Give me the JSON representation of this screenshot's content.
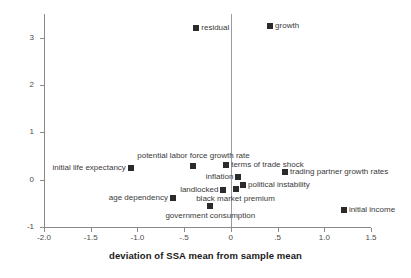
{
  "chart_data": {
    "type": "scatter",
    "title": "",
    "xlabel": "deviation of SSA mean from sample mean",
    "ylabel": "",
    "xlim": [
      -2.0,
      1.5
    ],
    "ylim": [
      -1.0,
      3.5
    ],
    "grid": false,
    "legend": "none",
    "zero_reference_line_x": 0,
    "xticks": [
      {
        "value": -2.0,
        "label": "-2.0"
      },
      {
        "value": -1.5,
        "label": "-1.5"
      },
      {
        "value": -1.0,
        "label": "-1.0"
      },
      {
        "value": -0.5,
        "label": "-.5"
      },
      {
        "value": 0.0,
        "label": "0"
      },
      {
        "value": 0.5,
        "label": ".5"
      },
      {
        "value": 1.0,
        "label": "1.0"
      },
      {
        "value": 1.5,
        "label": "1.5"
      }
    ],
    "yticks": [
      {
        "value": 3,
        "label": "3"
      },
      {
        "value": 2,
        "label": "2"
      },
      {
        "value": 1,
        "label": "1"
      },
      {
        "value": 0,
        "label": "0"
      },
      {
        "value": -1,
        "label": "-1"
      }
    ],
    "marker_color": "#2b2b2b",
    "axis_color": "#8a8a8a",
    "points": [
      {
        "label": "residual",
        "x": -0.37,
        "y": 3.2,
        "label_pos": "right"
      },
      {
        "label": "growth",
        "x": 0.42,
        "y": 3.25,
        "label_pos": "right"
      },
      {
        "label": "potential labor force growth rate",
        "x": -0.4,
        "y": 0.28,
        "label_pos": "above"
      },
      {
        "label": "initial life expectancy",
        "x": -1.07,
        "y": 0.25,
        "label_pos": "left"
      },
      {
        "label": "terms of trade shock",
        "x": -0.05,
        "y": 0.32,
        "label_pos": "right"
      },
      {
        "label": "trading partner growth rates",
        "x": 0.58,
        "y": 0.17,
        "label_pos": "right"
      },
      {
        "label": "inflation",
        "x": 0.08,
        "y": 0.06,
        "label_pos": "left"
      },
      {
        "label": "political instability",
        "x": 0.13,
        "y": -0.12,
        "label_pos": "right"
      },
      {
        "label": "landlocked",
        "x": -0.08,
        "y": -0.22,
        "label_pos": "left"
      },
      {
        "label": "black market premium",
        "x": 0.05,
        "y": -0.2,
        "label_pos": "below"
      },
      {
        "label": "age dependency",
        "x": -0.62,
        "y": -0.38,
        "label_pos": "left"
      },
      {
        "label": "government consumption",
        "x": -0.22,
        "y": -0.56,
        "label_pos": "below"
      },
      {
        "label": "initial income",
        "x": 1.21,
        "y": -0.65,
        "label_pos": "right"
      }
    ]
  }
}
